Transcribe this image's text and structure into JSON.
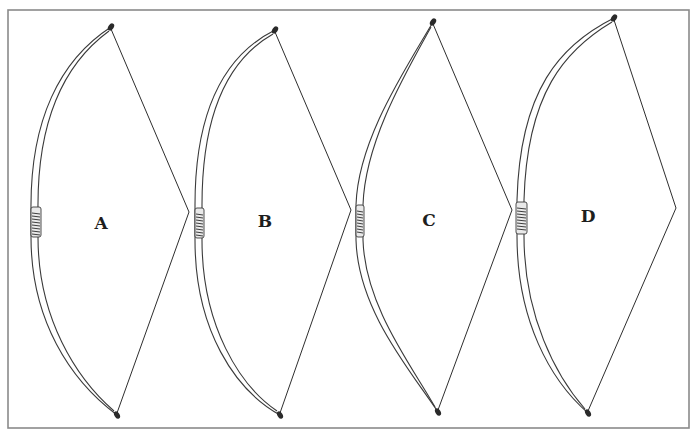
{
  "figure": {
    "width": 697,
    "height": 431,
    "frame": {
      "x": 8,
      "y": 10,
      "w": 681,
      "h": 418
    },
    "colors": {
      "ink": "#2e2e2e",
      "frame": "#8a8a8a",
      "background": "#ffffff"
    }
  },
  "bows": [
    {
      "label": "A",
      "label_pos": [
        101,
        223
      ],
      "top_tip": [
        111,
        27
      ],
      "bottom_tip": [
        117,
        415
      ],
      "string_apex": [
        189,
        212
      ],
      "grip": {
        "x": 31,
        "y": 207,
        "w": 10,
        "h": 30
      },
      "back_path": "M111,27 C60,60 30,120 31,210 L31,237 C31,320 70,380 117,415",
      "belly_path": "M109,31 C64,64 37,122 38,210 L38,237 C38,318 76,378 114,411"
    },
    {
      "label": "B",
      "label_pos": [
        265,
        221
      ],
      "top_tip": [
        275,
        30
      ],
      "bottom_tip": [
        280,
        415
      ],
      "string_apex": [
        351,
        210
      ],
      "grip": {
        "x": 195,
        "y": 208,
        "w": 9,
        "h": 30
      },
      "back_path": "M275,30 C225,55 195,110 195,205 L195,240 C195,330 235,390 280,415",
      "belly_path": "M273,34 C229,59 202,112 202,205 L202,240 C202,326 240,386 277,411"
    },
    {
      "label": "C",
      "label_pos": [
        429,
        220
      ],
      "top_tip": [
        433,
        22
      ],
      "bottom_tip": [
        438,
        412
      ],
      "string_apex": [
        512,
        210
      ],
      "grip": {
        "x": 356,
        "y": 205,
        "w": 8,
        "h": 32
      },
      "back_path": "M433,22 C405,70 358,140 356,205 L356,240 C358,310 410,370 438,412",
      "belly_path": "M431,27 C405,74 365,142 363,205 L363,240 C365,306 412,366 435,407"
    },
    {
      "label": "D",
      "label_pos": [
        588,
        216
      ],
      "top_tip": [
        614,
        18
      ],
      "bottom_tip": [
        588,
        413
      ],
      "string_apex": [
        676,
        208
      ],
      "grip": {
        "x": 516,
        "y": 202,
        "w": 11,
        "h": 32
      },
      "back_path": "M614,18 C560,45 520,90 517,200 L517,236 C517,320 550,380 588,413",
      "belly_path": "M612,22 C565,50 527,93 524,200 L524,236 C524,316 556,376 585,409"
    }
  ]
}
